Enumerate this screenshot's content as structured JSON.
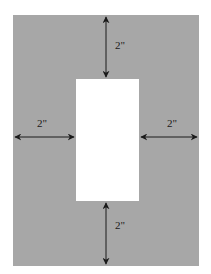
{
  "diagram": {
    "colors": {
      "mat": "#a7a7a7",
      "opening": "#ffffff",
      "arrow": "#1a1a1a"
    },
    "labels": {
      "top": "2\"",
      "bottom": "2\"",
      "left": "2\"",
      "right": "2\""
    }
  }
}
